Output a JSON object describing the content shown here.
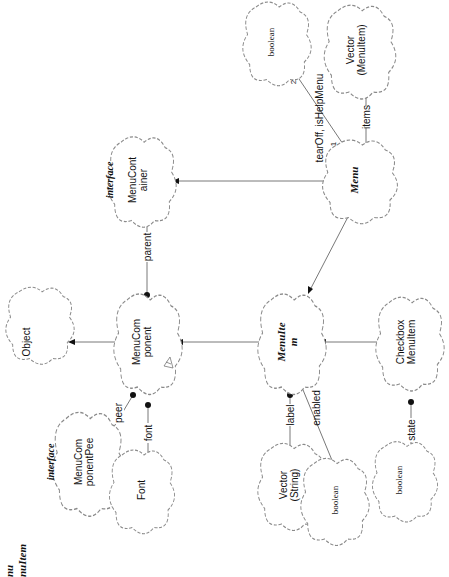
{
  "diagram": {
    "orientation": "rotated-90-ccw",
    "corner_title": [
      "nu",
      "nuItem"
    ],
    "classes": {
      "object": "Object",
      "menu_component": [
        "MenuCom",
        "ponent"
      ],
      "menu_component_peer": [
        "MenuCom",
        "ponentPee"
      ],
      "font": "Font",
      "menu_container": [
        "MenuCont",
        "ainer"
      ],
      "menu_item": [
        "MenuIte",
        "m"
      ],
      "menu": "Menu",
      "vector_string": [
        "Vector",
        "(String)"
      ],
      "boolean_enabled": "boolean",
      "checkbox_menu_item": [
        "Checkbox",
        "MenuItem"
      ],
      "boolean_state": "boolean",
      "boolean_flags": "boolean",
      "vector_menuitem": [
        "Vector",
        "(MenuItem)"
      ]
    },
    "stereotypes": {
      "menu_component_peer": "interface",
      "menu_container": "interface"
    },
    "associations": {
      "peer": "peer",
      "font": "font",
      "parent": "parent",
      "label": "label",
      "enabled": "enabled",
      "state": "state",
      "items": "items",
      "flags": "tearOff, isHelpMenu",
      "flags_mult_near": "1",
      "flags_mult_far": "2"
    },
    "colors": {
      "line": "#555555",
      "cloud_border": "#8a8a8a",
      "dot": "#111111",
      "background": "#ffffff"
    }
  }
}
